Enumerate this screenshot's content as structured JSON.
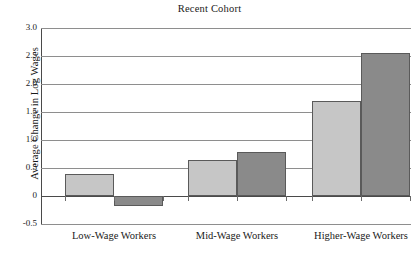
{
  "chart_data": {
    "type": "bar",
    "title": "Recent Cohort",
    "xlabel": "",
    "ylabel": "Average Change in Log Wages",
    "categories": [
      "Low-Wage Workers",
      "Mid-Wage Workers",
      "Higher-Wage Workers"
    ],
    "series": [
      {
        "name": "light-bar",
        "color": "#c6c6c6",
        "values": [
          0.4,
          0.65,
          1.7
        ]
      },
      {
        "name": "dark-bar",
        "color": "#8a8a8a",
        "values": [
          -0.17,
          0.79,
          2.55
        ]
      }
    ],
    "ylim": [
      -0.5,
      3.0
    ],
    "yticks": [
      3.0,
      2.5,
      2.0,
      1.5,
      1.0,
      0.5,
      0,
      -0.5
    ],
    "ytick_labels": [
      "3.0",
      "2.5",
      "2.0",
      "1.5",
      "1.0",
      "0.5",
      "0",
      "-0.5"
    ],
    "grid": true,
    "legend": "none",
    "zero_line": 0
  }
}
